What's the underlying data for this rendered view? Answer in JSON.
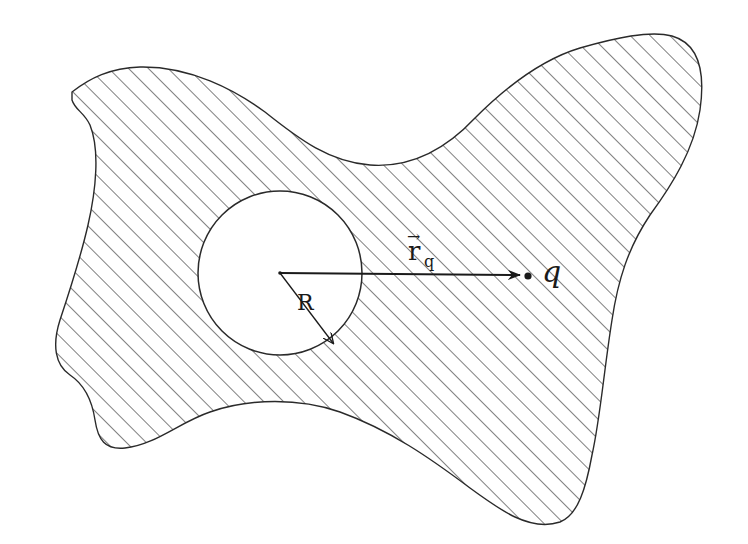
{
  "diagram": {
    "colors": {
      "stroke": "#2a2a2a",
      "hatch": "#3a3a3a",
      "background": "#ffffff",
      "cavity_fill": "#ffffff"
    },
    "conductor": {
      "fill_pattern": "diagonal-hatch",
      "hatch_angle_deg": 45
    },
    "cavity": {
      "shape": "circle",
      "center": [
        280,
        273
      ],
      "radius_px": 82
    },
    "labels": {
      "radius": "R",
      "position_vector": "r",
      "position_vector_arrow": "→",
      "position_vector_subscript": "q",
      "charge": "q"
    },
    "vectors": [
      {
        "name": "r_q",
        "from": [
          280,
          273
        ],
        "to": [
          520,
          275
        ]
      },
      {
        "name": "R",
        "from": [
          280,
          273
        ],
        "to": [
          333,
          343
        ]
      }
    ],
    "point_charge": {
      "label": "q",
      "position": [
        528,
        276
      ]
    }
  }
}
